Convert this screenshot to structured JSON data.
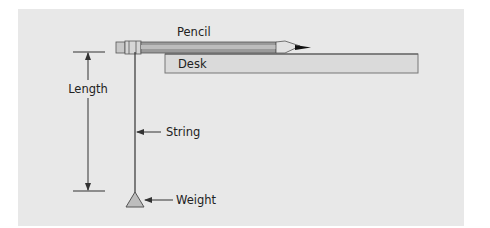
{
  "diagram": {
    "labels": {
      "pencil": "Pencil",
      "desk": "Desk",
      "length": "Length",
      "string": "String",
      "weight": "Weight"
    },
    "colors": {
      "background": "#e8e8e8",
      "desk_fill": "#dadada",
      "pencil_body": "#9a9a9a",
      "pencil_stripe": "#bdbdbd",
      "line": "#333333"
    }
  }
}
